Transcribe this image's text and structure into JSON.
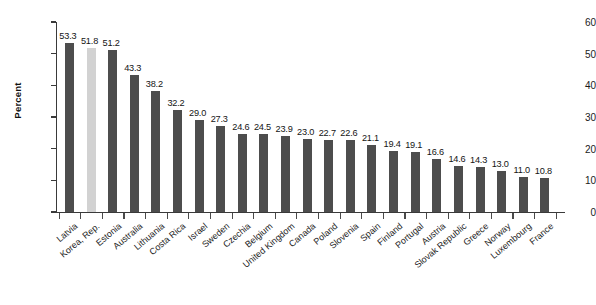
{
  "chart_data": {
    "type": "bar",
    "title": "",
    "subtitle": "",
    "xlabel": "",
    "ylabel": "Percent",
    "ylim": [
      0,
      60
    ],
    "ytick_step": 10,
    "yticks": [
      0,
      10,
      20,
      30,
      40,
      50,
      60
    ],
    "grid": false,
    "legend": null,
    "bar_color": "#4d4d4d",
    "highlight_color": "#d2d2d2",
    "highlight_index": 1,
    "value_label_format": "one-decimal",
    "categories": [
      "Latvia",
      "Korea, Rep.",
      "Estonia",
      "Australia",
      "Lithuania",
      "Costa Rica",
      "Israel",
      "Sweden",
      "Czechia",
      "Belgium",
      "United Kingdom",
      "Canada",
      "Poland",
      "Slovenia",
      "Spain",
      "Finland",
      "Portugal",
      "Austria",
      "Slovak Republic",
      "Greece",
      "Norway",
      "Luxembourg",
      "France"
    ],
    "values": [
      53.3,
      51.8,
      51.2,
      43.3,
      38.2,
      32.2,
      29.0,
      27.3,
      24.6,
      24.5,
      23.9,
      23.0,
      22.7,
      22.6,
      21.1,
      19.4,
      19.1,
      16.6,
      14.6,
      14.3,
      13.0,
      11.0,
      10.8
    ],
    "value_labels": [
      "53.3",
      "51.8",
      "51.2",
      "43.3",
      "38.2",
      "32.2",
      "29.0",
      "27.3",
      "24.6",
      "24.5",
      "23.9",
      "23.0",
      "22.7",
      "22.6",
      "21.1",
      "19.4",
      "19.1",
      "16.6",
      "14.6",
      "14.3",
      "13.0",
      "11.0",
      "10.8"
    ],
    "ytick_labels": [
      "0",
      "10",
      "20",
      "30",
      "40",
      "50",
      "60"
    ]
  }
}
